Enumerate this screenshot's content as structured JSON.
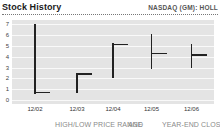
{
  "header": {
    "title": "Stock History",
    "ticker": "NASDAQ (GM): HOLL"
  },
  "chart_data": {
    "type": "bar",
    "subtype": "high-low-close",
    "title": "Stock History",
    "categories": [
      "12/02",
      "12/03",
      "12/04",
      "12/05",
      "12/06"
    ],
    "points": [
      {
        "date": "12/02",
        "high": 7.0,
        "low": 0.55,
        "close": 0.7
      },
      {
        "date": "12/03",
        "high": 2.5,
        "low": 0.65,
        "close": 2.4
      },
      {
        "date": "12/04",
        "high": 5.25,
        "low": 2.0,
        "close": 5.15
      },
      {
        "date": "12/05",
        "high": 6.1,
        "low": 2.9,
        "close": 4.3
      },
      {
        "date": "12/06",
        "high": 5.2,
        "low": 3.0,
        "close": 4.15
      }
    ],
    "xlabel": "",
    "ylabel": "",
    "ylim": [
      0,
      7
    ],
    "yticks": [
      0,
      1,
      2,
      3,
      4,
      5,
      6,
      7
    ],
    "grid": "horizontal-white-on-gray",
    "legend": "none",
    "colors": {
      "bar": "#222222",
      "plot_background": "#e4e4e4",
      "gridline": "#f9f9f9",
      "axis_text": "#444444"
    }
  },
  "footer": {
    "fragments": [
      "HIGH/LOW PRICE RANGE",
      "AND",
      "YEAR-END CLOSE ($)"
    ]
  }
}
